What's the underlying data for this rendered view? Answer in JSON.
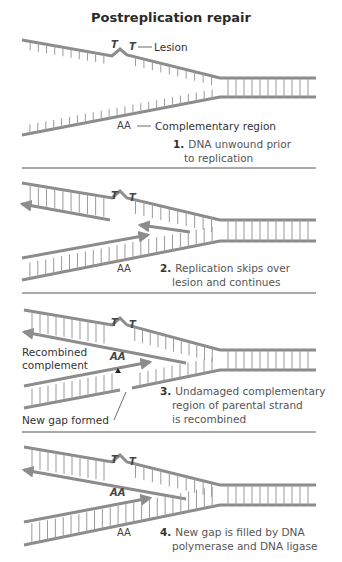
{
  "title": "Postreplication repair",
  "colors": {
    "strand": "#8c8c8c",
    "text": "#333333",
    "divider": "#555555"
  },
  "panels": [
    {
      "step_number": "1.",
      "step_lines": [
        "DNA unwound prior",
        "to replication"
      ],
      "labels": {
        "lesion": "Lesion",
        "lesion_bases": [
          "T",
          "T"
        ],
        "complement_bases": "AA",
        "complementary_region": "Complementary region"
      }
    },
    {
      "step_number": "2.",
      "step_lines": [
        "Replication skips over",
        "lesion and continues"
      ],
      "labels": {
        "lesion_bases": [
          "T",
          "T"
        ],
        "complement_bases": "AA"
      }
    },
    {
      "step_number": "3.",
      "step_lines": [
        "Undamaged complementary",
        "region of parental strand",
        "is recombined"
      ],
      "labels": {
        "lesion_bases": [
          "T",
          "T"
        ],
        "recombined_bases": "AA",
        "recombined_complement": [
          "Recombined",
          "complement"
        ],
        "new_gap": "New gap formed"
      }
    },
    {
      "step_number": "4.",
      "step_lines": [
        "New gap is filled by DNA",
        "polymerase and DNA ligase"
      ],
      "labels": {
        "lesion_bases": [
          "T",
          "T"
        ],
        "recombined_bases": "AA",
        "complement_bases": "AA"
      }
    }
  ]
}
